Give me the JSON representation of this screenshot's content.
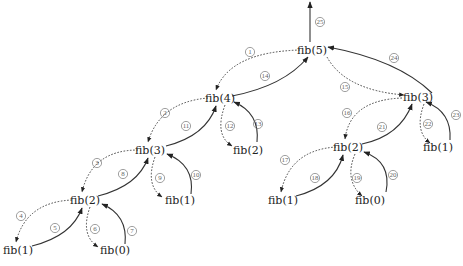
{
  "nodes": [
    {
      "id": "n5",
      "label": "fib(5)"
    },
    {
      "id": "n4",
      "label": "fib(4)"
    },
    {
      "id": "n3a",
      "label": "fib(3)"
    },
    {
      "id": "n2a",
      "label": "fib(2)"
    },
    {
      "id": "n1a",
      "label": "fib(1)"
    },
    {
      "id": "n0a",
      "label": "fib(0)"
    },
    {
      "id": "n1b",
      "label": "fib(1)"
    },
    {
      "id": "n2b",
      "label": "fib(2)"
    },
    {
      "id": "n3b",
      "label": "fib(3)"
    },
    {
      "id": "n2c",
      "label": "fib(2)"
    },
    {
      "id": "n1c",
      "label": "fib(1)"
    },
    {
      "id": "n0c",
      "label": "fib(0)"
    },
    {
      "id": "n1d",
      "label": "fib(1)"
    }
  ],
  "edges": [
    {
      "step": "1",
      "from": "n5",
      "to": "n4",
      "kind": "call"
    },
    {
      "step": "2",
      "from": "n4",
      "to": "n3a",
      "kind": "call"
    },
    {
      "step": "3",
      "from": "n3a",
      "to": "n2a",
      "kind": "call"
    },
    {
      "step": "4",
      "from": "n2a",
      "to": "n1a",
      "kind": "call"
    },
    {
      "step": "5",
      "from": "n1a",
      "to": "n2a",
      "kind": "return"
    },
    {
      "step": "6",
      "from": "n2a",
      "to": "n0a",
      "kind": "call"
    },
    {
      "step": "7",
      "from": "n0a",
      "to": "n2a",
      "kind": "return"
    },
    {
      "step": "8",
      "from": "n2a",
      "to": "n3a",
      "kind": "return"
    },
    {
      "step": "9",
      "from": "n3a",
      "to": "n1b",
      "kind": "call"
    },
    {
      "step": "10",
      "from": "n1b",
      "to": "n3a",
      "kind": "return"
    },
    {
      "step": "11",
      "from": "n3a",
      "to": "n4",
      "kind": "return"
    },
    {
      "step": "12",
      "from": "n4",
      "to": "n2b",
      "kind": "call"
    },
    {
      "step": "13",
      "from": "n2b",
      "to": "n4",
      "kind": "return"
    },
    {
      "step": "14",
      "from": "n4",
      "to": "n5",
      "kind": "return"
    },
    {
      "step": "15",
      "from": "n5",
      "to": "n3b",
      "kind": "call"
    },
    {
      "step": "16",
      "from": "n3b",
      "to": "n2c",
      "kind": "call"
    },
    {
      "step": "17",
      "from": "n2c",
      "to": "n1c",
      "kind": "call"
    },
    {
      "step": "18",
      "from": "n1c",
      "to": "n2c",
      "kind": "return"
    },
    {
      "step": "19",
      "from": "n2c",
      "to": "n0c",
      "kind": "call"
    },
    {
      "step": "20",
      "from": "n0c",
      "to": "n2c",
      "kind": "return"
    },
    {
      "step": "21",
      "from": "n2c",
      "to": "n3b",
      "kind": "return"
    },
    {
      "step": "22",
      "from": "n3b",
      "to": "n1d",
      "kind": "call"
    },
    {
      "step": "23",
      "from": "n1d",
      "to": "n3b",
      "kind": "return"
    },
    {
      "step": "24",
      "from": "n3b",
      "to": "n5",
      "kind": "return"
    },
    {
      "step": "25",
      "from": "n5",
      "to": "out",
      "kind": "return"
    }
  ]
}
